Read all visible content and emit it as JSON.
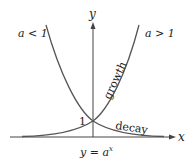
{
  "diagram": {
    "caption_main": "y = a",
    "caption_exp": "x",
    "axes": {
      "x_label": "x",
      "y_label": "y"
    },
    "intercept_label": "1",
    "curves": [
      {
        "name": "decay",
        "condition": "a < 1",
        "label": "decay"
      },
      {
        "name": "growth",
        "condition": "a > 1",
        "label": "growth"
      }
    ],
    "colors": {
      "curve": "#555555",
      "axis": "#444444",
      "text": "#222222"
    }
  }
}
